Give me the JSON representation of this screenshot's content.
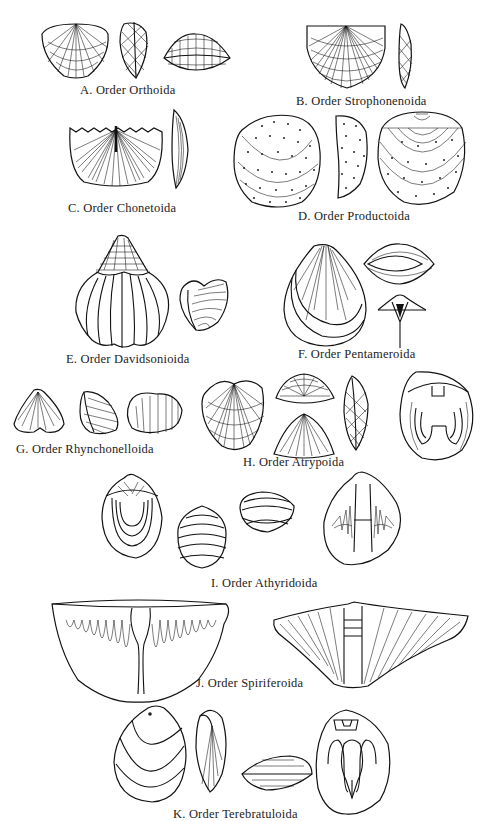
{
  "plate": {
    "subject": "Brachiopod orders",
    "captions": {
      "A": "A.  Order Orthoida",
      "B": "B. Order Strophonenoida",
      "C": "C.  Order Chonetoida",
      "D": "D. Order Productoida",
      "E": "E.  Order Davidsonioida",
      "F": "F. Order Pentameroida",
      "G": "G.  Order Rhynchonelloida",
      "H": "H.  Order Atrypoida",
      "I": "I. Order Athyridoida",
      "J": "J.  Order Spiriferoida",
      "K": "K.  Order Terebratuloida"
    },
    "figures": [
      {
        "id": "A",
        "views": 3
      },
      {
        "id": "B",
        "views": 2
      },
      {
        "id": "C",
        "views": 2
      },
      {
        "id": "D",
        "views": 3
      },
      {
        "id": "E",
        "views": 2
      },
      {
        "id": "F",
        "views": 3
      },
      {
        "id": "G",
        "views": 3
      },
      {
        "id": "H",
        "views": 5
      },
      {
        "id": "I",
        "views": 4
      },
      {
        "id": "J",
        "views": 2
      },
      {
        "id": "K",
        "views": 4
      }
    ]
  }
}
